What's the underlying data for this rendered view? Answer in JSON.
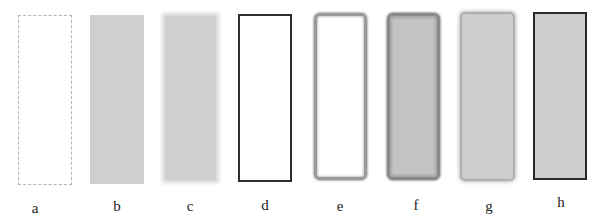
{
  "figure": {
    "panels": [
      {
        "id": "a",
        "label": "a",
        "style": "white fill, dashed light-gray outline"
      },
      {
        "id": "b",
        "label": "b",
        "style": "gray fill, no outline"
      },
      {
        "id": "c",
        "label": "c",
        "style": "gray fill, blurred edges"
      },
      {
        "id": "d",
        "label": "d",
        "style": "white fill, solid dark outline"
      },
      {
        "id": "e",
        "label": "e",
        "style": "white fill, blurred rounded gray outline"
      },
      {
        "id": "f",
        "label": "f",
        "style": "gray fill, blurred rounded dark outline"
      },
      {
        "id": "g",
        "label": "g",
        "style": "gray fill, soft shadow edge"
      },
      {
        "id": "h",
        "label": "h",
        "style": "gray fill, solid dark outline"
      }
    ],
    "colors": {
      "background": "#ffffff",
      "gray_fill": "#cfcfcf",
      "dark_outline": "#2e2e2e",
      "dashed_outline": "#b5b5b5"
    }
  }
}
